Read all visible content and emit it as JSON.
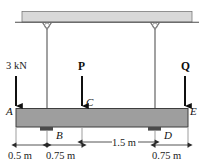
{
  "figure": {
    "colors": {
      "ceiling_fill": "#d9d9d9",
      "ceiling_stroke": "#6e6e6e",
      "beam_fill": "#9e9e9e",
      "beam_stroke": "#3d3d3d",
      "support_block": "#4a4a4a",
      "hanger": "#8a8a8a",
      "arrow": "#101010",
      "dimension_line": "#2a2a2a",
      "background": "#ffffff"
    }
  },
  "points": [
    {
      "id": "A",
      "label": "A"
    },
    {
      "id": "B",
      "label": "B"
    },
    {
      "id": "C",
      "label": "C"
    },
    {
      "id": "D",
      "label": "D"
    },
    {
      "id": "E",
      "label": "E"
    }
  ],
  "loads": [
    {
      "id": "load-a",
      "label": "3 kN",
      "at": "A",
      "direction": "down"
    },
    {
      "id": "load-p",
      "label": "P",
      "at": "C",
      "direction": "down"
    },
    {
      "id": "load-q",
      "label": "Q",
      "at": "E",
      "direction": "down"
    }
  ],
  "hangers": [
    {
      "id": "hanger-b",
      "from": "ceiling",
      "to": "B"
    },
    {
      "id": "hanger-d",
      "from": "ceiling",
      "to": "D"
    }
  ],
  "dimensions": [
    {
      "id": "dim-ab",
      "label": "0.5 m",
      "from": "A",
      "to": "B"
    },
    {
      "id": "dim-bc",
      "label": "0.75 m",
      "from": "B",
      "to": "C"
    },
    {
      "id": "dim-cd",
      "label": "1.5 m",
      "from": "C",
      "to": "D"
    },
    {
      "id": "dim-de",
      "label": "0.75 m",
      "from": "D",
      "to": "E"
    }
  ]
}
